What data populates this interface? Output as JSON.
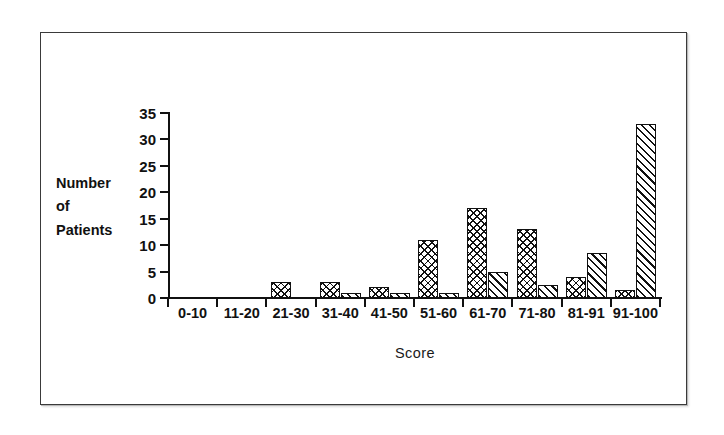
{
  "figure": {
    "frame_color": "#3a3a3a",
    "background": "#ffffff"
  },
  "axis": {
    "y_title_lines": [
      "Number",
      "of",
      "Patients"
    ],
    "x_title": "Score",
    "y_ticks": [
      "0",
      "5",
      "10",
      "15",
      "20",
      "25",
      "30",
      "35"
    ]
  },
  "chart_data": {
    "type": "bar",
    "title": "",
    "subtitle": "",
    "xlabel": "Score",
    "ylabel": "Number of Patients",
    "categories": [
      "0-10",
      "11-20",
      "21-30",
      "31-40",
      "41-50",
      "51-60",
      "61-70",
      "71-80",
      "81-91",
      "91-100"
    ],
    "series": [
      {
        "name": "series-1",
        "pattern": "crosshatch",
        "values": [
          0,
          0,
          3,
          3,
          2,
          11,
          17,
          13,
          4,
          1.5
        ]
      },
      {
        "name": "series-2",
        "pattern": "diagonal-stripes",
        "values": [
          0,
          0,
          0,
          1,
          1,
          1,
          5,
          2.5,
          8.5,
          33
        ]
      }
    ],
    "ylim": [
      0,
      35
    ],
    "ytick_step": 5,
    "grid": false,
    "legend": "none",
    "bar_edge_color": "#111111",
    "bar_fill_color": "#ffffff",
    "annotations": []
  }
}
